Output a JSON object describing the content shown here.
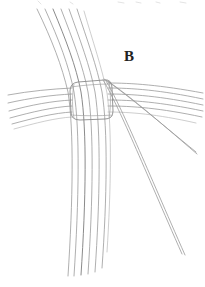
{
  "figure": {
    "label": "B",
    "label_x": 124,
    "label_y": 49,
    "background_color": "#ffffff",
    "line_color": "#9a9a9a",
    "line_color_dark": "#7d7d7d",
    "line_color_faint": "#b9b9b9",
    "label_color": "#222222",
    "width": 205,
    "height": 287
  },
  "chart_data": {
    "type": "line",
    "xlabel": "",
    "ylabel": "",
    "xlim": [
      0,
      205
    ],
    "ylim": [
      0,
      287
    ],
    "grid": false,
    "legend": "none",
    "annotations": [
      {
        "text": "B",
        "x": 124,
        "y": 49
      }
    ],
    "series": [
      {
        "name": "vertical-bundle-strand-1",
        "path": "M 37 9 C 52 40, 62 66, 68 92 C 74 130, 73 200, 68 276"
      },
      {
        "name": "vertical-bundle-strand-2",
        "path": "M 45 9 C 59 40, 69 66, 74 92 C 80 130, 79 200, 74 276"
      },
      {
        "name": "vertical-bundle-strand-3",
        "path": "M 53 9 C 66 40, 76 66, 81 92 C 87 130, 86 200, 81 275"
      },
      {
        "name": "vertical-bundle-strand-4",
        "path": "M 61 9 C 73 40, 83 66, 88 92 C 94 130, 93 200, 88 274"
      },
      {
        "name": "vertical-bundle-strand-5",
        "path": "M 69 9 C 80 40, 90 66, 95 92 C 101 130, 100 200, 95 272"
      },
      {
        "name": "vertical-bundle-strand-6",
        "path": "M 77 9 C 87 40, 97 66, 102 92 C 108 130, 107 198, 102 268"
      },
      {
        "name": "vertical-bundle-strand-7",
        "path": "M 84 11 C 93 42, 102 68, 107 93 C 112 128, 111 190, 107 252"
      },
      {
        "name": "horizontal-left-strand-1",
        "path": "M 8 95 C 30 91, 52 89, 72 88"
      },
      {
        "name": "horizontal-left-strand-2",
        "path": "M 8 103 C 30 98, 52 95, 72 94"
      },
      {
        "name": "horizontal-left-strand-3",
        "path": "M 9 111 C 31 105, 52 101, 72 100"
      },
      {
        "name": "horizontal-left-strand-4",
        "path": "M 10 118 C 32 112, 53 107, 72 106"
      },
      {
        "name": "horizontal-left-strand-5",
        "path": "M 12 124 C 34 118, 54 113, 72 112"
      },
      {
        "name": "horizontal-left-strand-6",
        "path": "M 14 129 C 36 123, 55 118, 72 117"
      },
      {
        "name": "horizontal-right-strand-1",
        "path": "M 108 83 C 132 83, 160 85, 203 93"
      },
      {
        "name": "horizontal-right-strand-2",
        "path": "M 108 88 C 132 88, 160 90, 203 99"
      },
      {
        "name": "horizontal-right-strand-3",
        "path": "M 108 94 C 132 94, 160 96, 203 105"
      },
      {
        "name": "horizontal-right-strand-4",
        "path": "M 108 100 C 132 100, 160 102, 203 111"
      },
      {
        "name": "horizontal-right-strand-5",
        "path": "M 108 106 C 132 106, 160 108, 202 117"
      },
      {
        "name": "horizontal-right-strand-6",
        "path": "M 108 112 C 130 112, 156 114, 196 123"
      },
      {
        "name": "diagonal-strand-upper-a",
        "path": "M 104 79 C 124 92, 152 116, 196 152"
      },
      {
        "name": "diagonal-strand-upper-b",
        "path": "M 106 80 C 126 93, 154 117, 197 154"
      },
      {
        "name": "diagonal-strand-lower-a",
        "path": "M 103 80 C 118 104, 144 168, 182 254"
      },
      {
        "name": "diagonal-strand-lower-b",
        "path": "M 106 81 C 121 105, 147 169, 185 255"
      },
      {
        "name": "wrap-binding-outline",
        "path": "M 78 82 L 104 80 Q 112 79 112 88 L 113 111 Q 113 119 105 119 L 80 120 Q 71 120 71 112 L 70 91 Q 70 83 78 82 Z"
      }
    ]
  }
}
